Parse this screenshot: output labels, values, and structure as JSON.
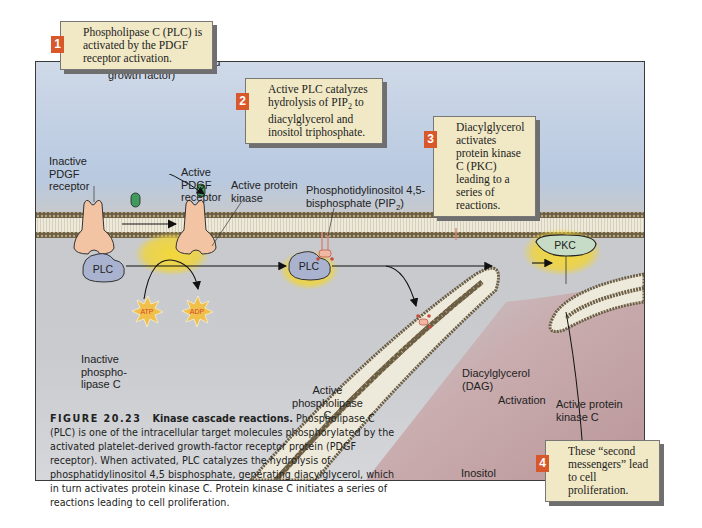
{
  "callouts": [
    {
      "num": "1",
      "text": "Phospholipase C (PLC) is activated by the PDGF receptor activation."
    },
    {
      "num": "2",
      "text_a": "Active PLC catalyzes hydrolysis of PIP",
      "text_sub": "2",
      "text_b": " to diacylglycerol and inositol triphosphate."
    },
    {
      "num": "3",
      "text": "Diacylglycerol activates protein kinase C (PKC) leading to a series of reactions."
    },
    {
      "num": "4",
      "text": "These “second messengers” lead to cell proliferation."
    }
  ],
  "labels": {
    "pdgf": "PDGF (platelet-derived growth factor)",
    "inactive_receptor": "Inactive PDGF receptor",
    "active_receptor": "Active PDGF receptor",
    "active_protein_kinase": "Active protein kinase",
    "pip2_a": "Phosphotidylinositol 4,5-bisphosphate (PIP",
    "pip2_sub": "2",
    "pip2_b": ")",
    "plc": "PLC",
    "inactive_plc": "Inactive phospho- lipase C",
    "active_plc": "Active phospholipase C",
    "atp": "ATP",
    "adp": "ADP",
    "dag": "Diacylglycerol (DAG)",
    "activation": "Activation",
    "pkc": "PKC",
    "active_pkc": "Active protein kinase C",
    "ip3_a": "Inositol triphosphate (IP",
    "ip3_sub": "3",
    "ip3_b": " )"
  },
  "caption": {
    "figure": "FIGURE 20.23",
    "title": "Kinase cascade reactions.",
    "body": "Phospholipase C (PLC) is one of the intracellular target molecules phosphorylated by the activated platelet-derived growth-factor receptor protein (PDGF receptor). When activated, PLC catalyzes the hydrolysis of phosphatidylinositol 4,5 bisphosphate, generating diacylglycerol, which in turn activates protein kinase C. Protein kinase C initiates a series of reactions leading to cell proliferation."
  },
  "colors": {
    "callout_bg": "#f1e9c5",
    "badge": "#d9582b",
    "receptor": "#f2c4a4",
    "pdgf": "#3f9a5c",
    "plc": "#a9b2cf",
    "pkc": "#c7dcc6",
    "glow": "#f0d43a",
    "cytoplasm_pink": "#c9a9ab"
  }
}
